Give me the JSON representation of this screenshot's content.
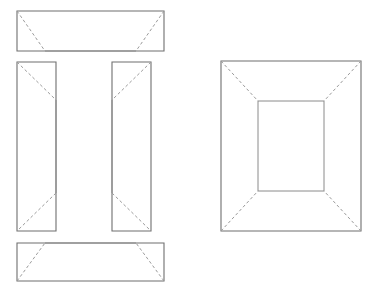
{
  "drawing": {
    "title": "Box panel layout and assembled box view",
    "background_color": "#ffffff",
    "solid_line_color": "#8a8a8a",
    "dashed_line_color": "#9b9b9b",
    "canvas": {
      "width": 380,
      "height": 284
    },
    "groups": [
      {
        "name": "flat-panel-layout",
        "label": "Flat panel layout",
        "panels": [
          {
            "name": "top-panel",
            "label": "Top panel",
            "outer": {
              "x": 17,
              "y": 11,
              "width": 147,
              "height": 40
            },
            "inner_edge": {
              "x1": 45,
              "y1": 51,
              "x2": 136,
              "y2": 51
            },
            "taper": "bottom",
            "diagonals": [
              {
                "x1": 17,
                "y1": 11,
                "x2": 45,
                "y2": 51
              },
              {
                "x1": 164,
                "y1": 11,
                "x2": 136,
                "y2": 51
              }
            ]
          },
          {
            "name": "left-side-panel",
            "label": "Left side panel",
            "outer": {
              "x": 17,
              "y": 62,
              "width": 39,
              "height": 169
            },
            "taper": "right",
            "diagonals": [
              {
                "x1": 17,
                "y1": 62,
                "x2": 56,
                "y2": 100
              },
              {
                "x1": 56,
                "y1": 193,
                "x2": 17,
                "y2": 231
              }
            ]
          },
          {
            "name": "right-side-panel",
            "label": "Right side panel",
            "outer": {
              "x": 112,
              "y": 62,
              "width": 39,
              "height": 169
            },
            "taper": "left",
            "diagonals": [
              {
                "x1": 151,
                "y1": 62,
                "x2": 112,
                "y2": 100
              },
              {
                "x1": 112,
                "y1": 193,
                "x2": 151,
                "y2": 231
              }
            ]
          },
          {
            "name": "bottom-panel",
            "label": "Bottom panel",
            "outer": {
              "x": 17,
              "y": 243,
              "width": 147,
              "height": 38
            },
            "inner_edge": {
              "x1": 45,
              "y1": 243,
              "x2": 136,
              "y2": 243
            },
            "taper": "top",
            "diagonals": [
              {
                "x1": 17,
                "y1": 281,
                "x2": 45,
                "y2": 243
              },
              {
                "x1": 164,
                "y1": 281,
                "x2": 136,
                "y2": 243
              }
            ]
          }
        ]
      },
      {
        "name": "assembled-box-view",
        "label": "Assembled box view",
        "outer_rect": {
          "x": 221,
          "y": 61,
          "width": 140,
          "height": 170
        },
        "inner_rect": {
          "x": 258,
          "y": 101,
          "width": 66,
          "height": 90
        },
        "diagonals": [
          {
            "name": "corner-diagonal-top-left",
            "x1": 221,
            "y1": 61,
            "x2": 258,
            "y2": 101
          },
          {
            "name": "corner-diagonal-top-right",
            "x1": 361,
            "y1": 61,
            "x2": 324,
            "y2": 101
          },
          {
            "name": "corner-diagonal-bottom-left",
            "x1": 221,
            "y1": 231,
            "x2": 258,
            "y2": 191
          },
          {
            "name": "corner-diagonal-bottom-right",
            "x1": 361,
            "y1": 231,
            "x2": 324,
            "y2": 191
          }
        ]
      }
    ]
  }
}
